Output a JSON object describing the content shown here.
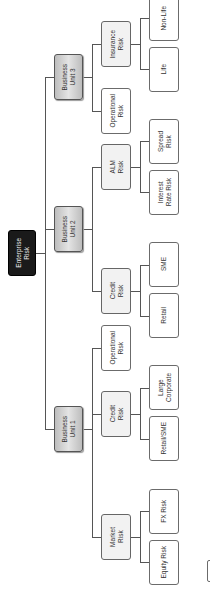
{
  "diagram": {
    "title": "Enterprise Risk",
    "root": {
      "label": "Enterprise\nRisk"
    },
    "business_units": [
      {
        "label": "Business\nUnit 1"
      },
      {
        "label": "Business\nUnit 2"
      },
      {
        "label": "Business\nUnit 3"
      }
    ],
    "level2": {
      "bu1_market": "Market\nRisk",
      "bu1_credit": "Credit\nRisk",
      "bu1_operational": "Operational\nRisk",
      "bu2_credit": "Credit\nRisk",
      "bu2_alm": "ALM\nRisk",
      "bu3_operational": "Operational\nRisk",
      "bu3_insurance": "Insurance\nRisk"
    },
    "level3": {
      "equity": "Equity Risk",
      "fx": "FX Risk",
      "retail_sme": "Retail/SME",
      "large_corporate": "Large\nCorporate",
      "retail": "Retail",
      "sme": "SME",
      "interest_rate": "Interest\nRate Risk",
      "spread": "Spread\nRisk",
      "life": "Life",
      "non_life": "Non-Life"
    }
  }
}
